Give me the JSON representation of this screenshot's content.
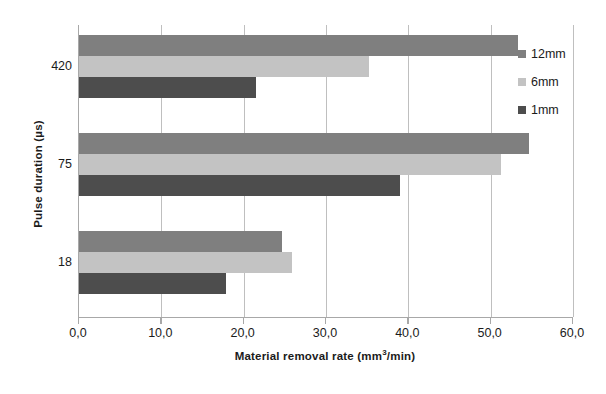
{
  "chart_data": {
    "type": "bar",
    "orientation": "horizontal",
    "title": "",
    "xlabel": "Material removal rate (mm³/min)",
    "ylabel": "Pulse duration (µs)",
    "categories": [
      "18",
      "75",
      "420"
    ],
    "category_order_top_to_bottom": [
      "420",
      "75",
      "18"
    ],
    "series": [
      {
        "name": "12mm",
        "color": "#7f7f7f",
        "values": [
          24.7,
          54.7,
          53.3
        ]
      },
      {
        "name": "6mm",
        "color": "#c3c3c3",
        "values": [
          25.9,
          51.3,
          35.2
        ]
      },
      {
        "name": "1mm",
        "color": "#4d4d4d",
        "values": [
          17.9,
          39.0,
          21.5
        ]
      }
    ],
    "xlim": [
      0,
      60
    ],
    "xticks": [
      0,
      10,
      20,
      30,
      40,
      50,
      60
    ],
    "xtick_labels": [
      "0,0",
      "10,0",
      "20,0",
      "30,0",
      "40,0",
      "50,0",
      "60,0"
    ],
    "grid": "vertical",
    "legend_position": "right"
  },
  "axes": {
    "y_title": "Pulse duration (µs)",
    "x_title_main": "Material removal rate (mm",
    "x_title_sup": "3",
    "x_title_tail": "/min)"
  },
  "legend": {
    "items": [
      {
        "label": "12mm",
        "color": "#7f7f7f"
      },
      {
        "label": "6mm",
        "color": "#c3c3c3"
      },
      {
        "label": "1mm",
        "color": "#4d4d4d"
      }
    ]
  },
  "colors": {
    "axis": "#a8a8a8",
    "grid": "#bfbfbf",
    "text": "#1b1b1b",
    "background": "#ffffff"
  }
}
